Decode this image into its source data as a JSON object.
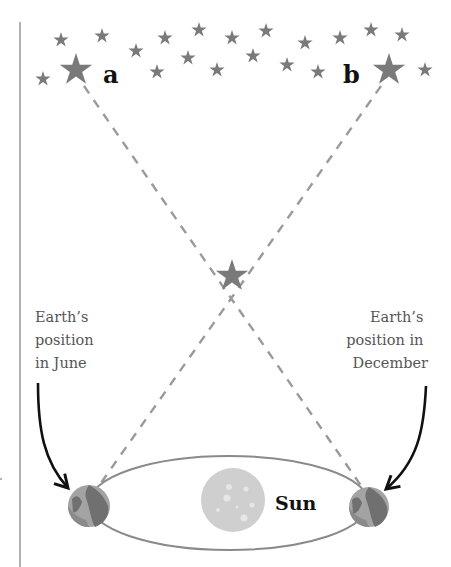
{
  "labels": {
    "star_a": "a",
    "star_b": "b",
    "sun": "Sun",
    "june": [
      "Earth’s",
      "position",
      "in June"
    ],
    "december": [
      "Earth’s",
      "position in",
      "December"
    ]
  },
  "colors": {
    "star": "#7a7a7a",
    "dashed_line": "#9a9a9a",
    "orbit": "#8a8a8a",
    "sun": "#cfcfcf",
    "earth_ocean": "#9a9a9a",
    "earth_land": "#6e6e6e",
    "arrow": "#111111",
    "divider": "#999999"
  },
  "stars_small": [
    [
      61,
      40
    ],
    [
      102,
      36
    ],
    [
      43,
      79
    ],
    [
      136,
      51
    ],
    [
      157,
      72
    ],
    [
      165,
      38
    ],
    [
      188,
      58
    ],
    [
      199,
      30
    ],
    [
      217,
      70
    ],
    [
      232,
      38
    ],
    [
      253,
      56
    ],
    [
      266,
      31
    ],
    [
      287,
      65
    ],
    [
      305,
      43
    ],
    [
      318,
      72
    ],
    [
      340,
      38
    ],
    [
      371,
      30
    ],
    [
      402,
      35
    ],
    [
      425,
      70
    ]
  ],
  "stars_big": {
    "a": [
      76,
      68
    ],
    "b": [
      389,
      68
    ]
  },
  "star_near": [
    232,
    275
  ]
}
